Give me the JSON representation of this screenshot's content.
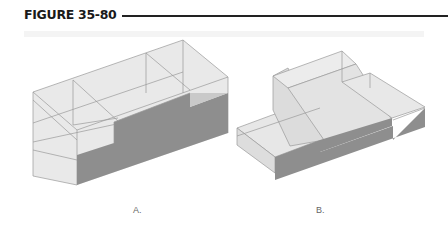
{
  "figure": {
    "title": "FIGURE 35-80",
    "panels": [
      {
        "id": "A",
        "caption": "A.",
        "description": "Isometric view of block with sloped rear face, central raised step, transparent hidden edges"
      },
      {
        "id": "B",
        "caption": "B.",
        "description": "Isometric view of stepped block with inclined face and low front ledge"
      }
    ],
    "colors": {
      "solid_face": "#8f8f8f",
      "transparent_face": "#e6e6e6",
      "edge": "#9a9a9a",
      "title": "#1a1a1a",
      "rule": "#222222"
    }
  }
}
